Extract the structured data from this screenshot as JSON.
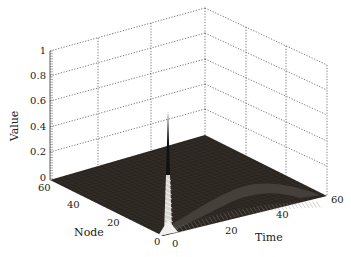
{
  "chart_data": {
    "type": "surface3d",
    "title": "",
    "xlabel": "Time",
    "ylabel": "Node",
    "zlabel": "Value",
    "xlim": [
      0,
      60
    ],
    "ylim": [
      0,
      60
    ],
    "zlim": [
      0,
      1
    ],
    "x_ticks": [
      "0",
      "20",
      "40",
      "60"
    ],
    "y_ticks": [
      "0",
      "20",
      "40",
      "60"
    ],
    "z_ticks": [
      "0",
      "0.2",
      "0.4",
      "0.6",
      "0.8",
      "1"
    ],
    "grid": true,
    "colormap": "dark (near-black surface with white mesh edges)",
    "peak": {
      "time": 0,
      "node": 0,
      "value": 0.65
    },
    "surface_color": "#2a2520",
    "mesh_color": "#ffffff"
  },
  "labels": {
    "value": "Value",
    "node": "Node",
    "time": "Time"
  },
  "ticks": {
    "z": [
      "0",
      "0.2",
      "0.4",
      "0.6",
      "0.8",
      "1"
    ],
    "node": [
      "60",
      "40",
      "20",
      "0"
    ],
    "time": [
      "0",
      "20",
      "40",
      "60"
    ]
  }
}
